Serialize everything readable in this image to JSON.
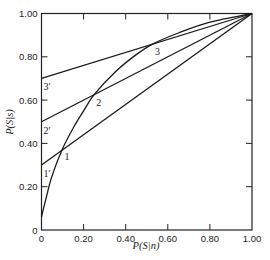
{
  "chart_data": {
    "type": "line",
    "title": "",
    "xlabel": "P(S|n)",
    "ylabel": "P(S|s)",
    "xlim": [
      0,
      1
    ],
    "ylim": [
      0,
      1
    ],
    "grid": false,
    "x_ticks": [
      "0",
      "0.20",
      "0.40",
      "0.60",
      "0.80",
      "1.00"
    ],
    "y_ticks": [
      "0",
      "0.20",
      "0.40",
      "0.60",
      "0.80",
      "1.00"
    ],
    "series": [
      {
        "name": "ROC curve",
        "points": [
          [
            0,
            0.06
          ],
          [
            0.02,
            0.14
          ],
          [
            0.05,
            0.25
          ],
          [
            0.1,
            0.375
          ],
          [
            0.15,
            0.47
          ],
          [
            0.2,
            0.55
          ],
          [
            0.25,
            0.625
          ],
          [
            0.35,
            0.73
          ],
          [
            0.45,
            0.81
          ],
          [
            0.53,
            0.86
          ],
          [
            0.65,
            0.91
          ],
          [
            0.8,
            0.96
          ],
          [
            1.0,
            1.0
          ]
        ]
      },
      {
        "name": "Line 1",
        "points": [
          [
            0,
            0.3
          ],
          [
            1.0,
            1.0
          ]
        ]
      },
      {
        "name": "Line 2",
        "points": [
          [
            0,
            0.5
          ],
          [
            1.0,
            1.0
          ]
        ]
      },
      {
        "name": "Line 3",
        "points": [
          [
            0,
            0.7
          ],
          [
            1.0,
            1.0
          ]
        ]
      }
    ],
    "annotations": [
      {
        "text": "1",
        "x": 0.1,
        "y": 0.375
      },
      {
        "text": "2",
        "x": 0.25,
        "y": 0.625
      },
      {
        "text": "3",
        "x": 0.53,
        "y": 0.86
      },
      {
        "text": "1′",
        "x": 0,
        "y": 0.3
      },
      {
        "text": "2′",
        "x": 0,
        "y": 0.5
      },
      {
        "text": "3′",
        "x": 0,
        "y": 0.7
      }
    ]
  }
}
